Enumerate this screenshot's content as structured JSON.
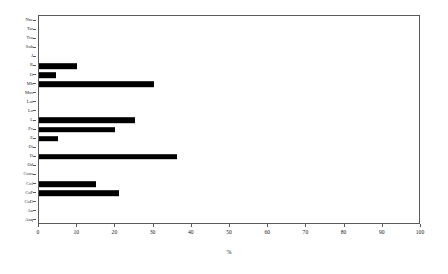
{
  "chart_data": {
    "type": "bar",
    "orientation": "horizontal",
    "title": "",
    "xlabel": "%",
    "ylabel": "",
    "xlim": [
      0,
      100
    ],
    "xticks": [
      0,
      10,
      20,
      30,
      40,
      50,
      60,
      70,
      80,
      90,
      100
    ],
    "grid": false,
    "legend": null,
    "bar_color": "#000000",
    "frame_color": "#5a5a5a",
    "categories": [
      "Nne",
      "Tar",
      "Tro",
      "Sub",
      "J",
      "R",
      "O",
      "Mb",
      "Mus",
      "Lat",
      "Lo",
      "L",
      "Pv",
      "E",
      "Di",
      "D",
      "Od",
      "Cons",
      "Col",
      "CoP",
      "CoD",
      "An",
      "Anq"
    ],
    "values": [
      0,
      0,
      0,
      0,
      0,
      10,
      4.5,
      30,
      0,
      0,
      0,
      25,
      20,
      5,
      0,
      36,
      0,
      0,
      15,
      21,
      0,
      0,
      0
    ]
  },
  "axis": {
    "x_title": "%"
  }
}
